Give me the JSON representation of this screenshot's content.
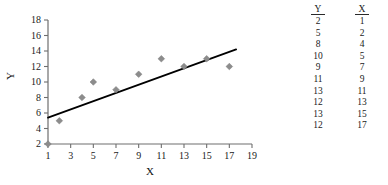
{
  "chart_data": {
    "type": "scatter",
    "title": "",
    "xlabel": "X",
    "ylabel": "Y",
    "xlim": [
      1,
      19
    ],
    "ylim": [
      2,
      18
    ],
    "xticks": [
      1,
      3,
      5,
      7,
      9,
      11,
      13,
      15,
      17,
      19
    ],
    "yticks": [
      2,
      4,
      6,
      8,
      10,
      12,
      14,
      16,
      18
    ],
    "grid": false,
    "legend": false,
    "marker": "diamond",
    "marker_color": "#8c8c8c",
    "x": [
      1,
      2,
      4,
      5,
      7,
      9,
      11,
      13,
      15,
      17
    ],
    "y": [
      2,
      5,
      8,
      10,
      9,
      11,
      13,
      12,
      13,
      12
    ],
    "points": [
      {
        "x": 1,
        "y": 2
      },
      {
        "x": 2,
        "y": 5
      },
      {
        "x": 4,
        "y": 8
      },
      {
        "x": 5,
        "y": 10
      },
      {
        "x": 7,
        "y": 9
      },
      {
        "x": 9,
        "y": 11
      },
      {
        "x": 11,
        "y": 13
      },
      {
        "x": 13,
        "y": 12
      },
      {
        "x": 15,
        "y": 13
      },
      {
        "x": 17,
        "y": 12
      }
    ],
    "trendline": {
      "type": "line",
      "color": "#000000",
      "x_start": 1,
      "y_start": 5.4,
      "x_end": 17.6,
      "y_end": 14.2
    }
  },
  "axis": {
    "x_title": "X",
    "y_title": "Y",
    "x_tick_labels": [
      "1",
      "3",
      "5",
      "7",
      "9",
      "11",
      "13",
      "15",
      "17",
      "19"
    ],
    "y_tick_labels": [
      "2",
      "4",
      "6",
      "8",
      "10",
      "12",
      "14",
      "16",
      "18"
    ]
  },
  "table": {
    "headers": [
      "Y",
      "X"
    ],
    "rows": [
      [
        "2",
        "1"
      ],
      [
        "5",
        "2"
      ],
      [
        "8",
        "4"
      ],
      [
        "10",
        "5"
      ],
      [
        "9",
        "7"
      ],
      [
        "11",
        "9"
      ],
      [
        "13",
        "11"
      ],
      [
        "12",
        "13"
      ],
      [
        "13",
        "15"
      ],
      [
        "12",
        "17"
      ]
    ]
  },
  "colors": {
    "marker": "#8c8c8c",
    "line": "#000000",
    "axis": "#6e6e6e",
    "text": "#1a1a1a"
  }
}
